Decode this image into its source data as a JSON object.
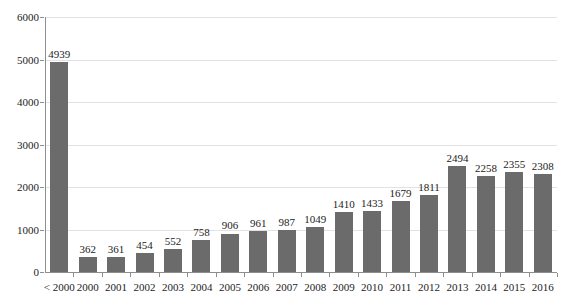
{
  "chart_data": {
    "type": "bar",
    "title": "",
    "subtitle": "",
    "xlabel": "",
    "ylabel": "",
    "ylim": [
      0,
      6000
    ],
    "ytick_labels": [
      "0",
      "1000",
      "2000",
      "3000",
      "4000",
      "5000",
      "6000"
    ],
    "yticks": [
      0,
      1000,
      2000,
      3000,
      4000,
      5000,
      6000
    ],
    "grid": true,
    "legend": false,
    "legend_position": "none",
    "bar_color": "#6b6b6b",
    "categories": [
      "< 2000",
      "2000",
      "2001",
      "2002",
      "2003",
      "2004",
      "2005",
      "2006",
      "2007",
      "2008",
      "2009",
      "2010",
      "2011",
      "2012",
      "2013",
      "2014",
      "2015",
      "2016"
    ],
    "values": [
      4939,
      362,
      361,
      454,
      552,
      758,
      906,
      961,
      987,
      1049,
      1410,
      1433,
      1679,
      1811,
      2494,
      2258,
      2355,
      2308
    ],
    "data_labels": [
      "4939",
      "362",
      "361",
      "454",
      "552",
      "758",
      "906",
      "961",
      "987",
      "1049",
      "1410",
      "1433",
      "1679",
      "1811",
      "2494",
      "2258",
      "2355",
      "2308"
    ]
  }
}
